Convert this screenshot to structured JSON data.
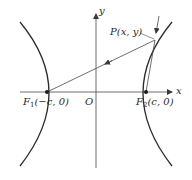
{
  "diagram": {
    "type": "hyperbola-reflection",
    "axes": {
      "x_label": "x",
      "y_label": "y",
      "origin_label": "O"
    },
    "point_p": {
      "label": "P(x, y)"
    },
    "focus_1": {
      "name": "F",
      "subscript": "1",
      "coords": "(−c, 0)"
    },
    "focus_2": {
      "name": "F",
      "subscript": "2",
      "coords": "(c, 0)"
    },
    "colors": {
      "curve": "#2b2b2b",
      "line": "#4a4a4a",
      "background": "#ffffff"
    }
  }
}
